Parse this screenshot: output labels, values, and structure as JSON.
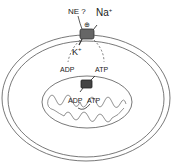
{
  "labels": {
    "ne": "NE ?",
    "na": "Na",
    "na_sup": "+",
    "plus_sign": "⊕",
    "k": "K",
    "k_sup": "+",
    "adp_cyto": "ADP",
    "atp_cyto": "ATP",
    "adp_mito": "ADP",
    "atp_mito": "ATP"
  },
  "colors": {
    "line": "#333333",
    "pump_fill": "#666666",
    "translocase_fill": "#444444",
    "background": "#ffffff"
  }
}
